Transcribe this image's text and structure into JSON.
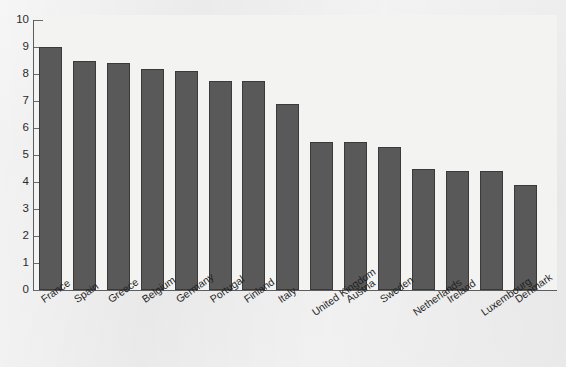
{
  "chart_data": {
    "type": "bar",
    "title": "",
    "xlabel": "",
    "ylabel": "",
    "ylim": [
      0,
      10
    ],
    "grid": false,
    "legend": "none",
    "y_ticks": [
      "0",
      "1",
      "2",
      "3",
      "4",
      "5",
      "6",
      "7",
      "8",
      "9",
      "10"
    ],
    "categories": [
      "France",
      "Spain",
      "Greece",
      "Belgium",
      "Germany",
      "Portugal",
      "Finland",
      "Italy",
      "United Kingdom",
      "Austria",
      "Sweden",
      "Netherlands",
      "Ireland",
      "Luxembourg",
      "Denmark"
    ],
    "values": [
      9.0,
      8.5,
      8.4,
      8.2,
      8.1,
      7.75,
      7.75,
      6.9,
      5.5,
      5.5,
      5.3,
      4.5,
      4.4,
      4.4,
      3.9
    ],
    "bar_color": "#595959",
    "bar_edge_color": "#3a3a3a",
    "plot_background": "#f3f3f2",
    "page_background": "#e9e9e9",
    "axis_color": "#5d5d5d"
  }
}
